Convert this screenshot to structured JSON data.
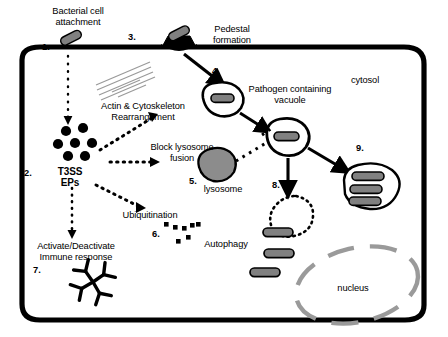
{
  "figure": {
    "cell_label": "cytosol",
    "nucleus_label": "nucleus",
    "colors": {
      "membrane": "#000000",
      "bacterium_fill": "#808080",
      "bacterium_stroke": "#000000",
      "nucleus_stroke": "#999999",
      "actin_lines": "#999999",
      "lysosome_fill": "#8c8c8c",
      "pedestal": "#000000",
      "background": "#ffffff"
    }
  },
  "steps": [
    {
      "id": "1",
      "number": "1.",
      "label": "Bacterial cell\nattachment"
    },
    {
      "id": "2",
      "number": "2.",
      "label": "T3SS\nEPs"
    },
    {
      "id": "3",
      "number": "3.",
      "label": "Pedestal\nformation"
    },
    {
      "id": "4",
      "number": "4.",
      "label": "Pathogen containing\nvacuole"
    },
    {
      "id": "5",
      "number": "5.",
      "label": "lysosome"
    },
    {
      "id": "6",
      "number": "6.",
      "label": "Autophagy"
    },
    {
      "id": "7",
      "number": "7.",
      "label": "Activate/Deactivate\nImmune response"
    },
    {
      "id": "8",
      "number": "8.",
      "label": ""
    },
    {
      "id": "9",
      "number": "9.",
      "label": ""
    }
  ],
  "annotations": {
    "attachment": "Bacterial cell\nattachment",
    "pedestal": "Pedestal\nformation",
    "actin": "Actin & Cytoskeleton\nRearrangement",
    "t3ss": "T3SS\nEPs",
    "block_lysosome": "Block lysosome\nfusion",
    "pathogen_vacuole": "Pathogen containing\nvacuole",
    "lysosome": "lysosome",
    "ubiquitination": "Ubiquitination",
    "autophagy": "Autophagy",
    "immune": "Activate/Deactivate\nImmune response",
    "cytosol": "cytosol",
    "nucleus": "nucleus"
  },
  "numbers": {
    "n1": "1.",
    "n2": "2.",
    "n3": "3.",
    "n4": "4.",
    "n5": "5.",
    "n6": "6.",
    "n7": "7.",
    "n8": "8.",
    "n9": "9."
  }
}
